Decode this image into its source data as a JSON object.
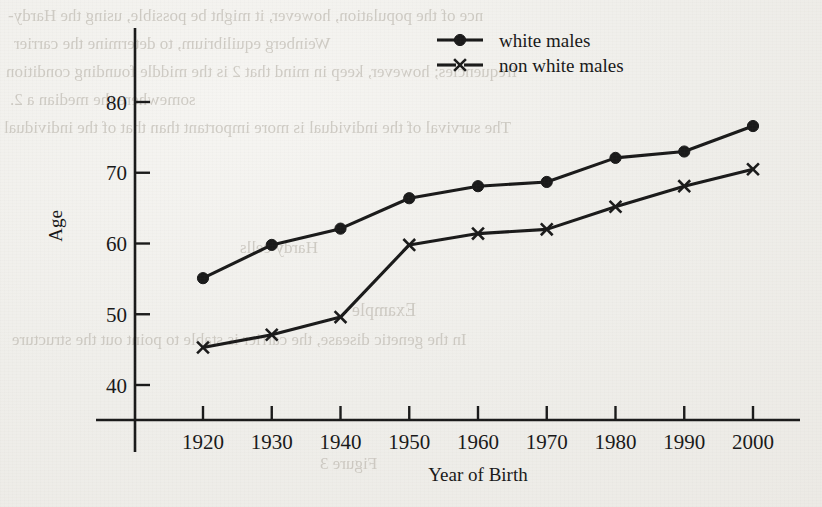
{
  "figure": {
    "kind": "scanned-book-figure",
    "ink_color": "#1a1a1a",
    "paper_color": "#f1efec"
  },
  "bleed_through_text": [
    {
      "text": "nce of the population, however, it might be possible, using the Hardy-",
      "x": 8,
      "y": 6,
      "size": 17
    },
    {
      "text": "Weinberg equilibrium, to determine the carrier",
      "x": 14,
      "y": 34,
      "size": 17
    },
    {
      "text": "frequencies; however, keep in mind that 2 is the middle founding condition",
      "x": 6,
      "y": 62,
      "size": 17
    },
    {
      "text": "somewhere the median a 2.",
      "x": 10,
      "y": 90,
      "size": 17
    },
    {
      "text": "The survival of the individual is more important than that of the individual",
      "x": 4,
      "y": 118,
      "size": 17
    },
    {
      "text": "Example",
      "x": 352,
      "y": 300,
      "size": 18
    },
    {
      "text": "In the genetic disease, the carrier is stable to point out the structure",
      "x": 12,
      "y": 330,
      "size": 17
    },
    {
      "text": "Hardy cells",
      "x": 240,
      "y": 238,
      "size": 17
    },
    {
      "text": "Figure 3",
      "x": 320,
      "y": 454,
      "size": 17
    }
  ],
  "chart_data": {
    "type": "line",
    "title": "",
    "xlabel": "Year of Birth",
    "ylabel": "Age",
    "x": [
      1920,
      1930,
      1940,
      1950,
      1960,
      1970,
      1980,
      1990,
      2000
    ],
    "xtick_labels": [
      "1920",
      "1930",
      "1940",
      "1950",
      "1960",
      "1970",
      "1980",
      "1990",
      "2000"
    ],
    "ytick_labels": [
      "40",
      "50",
      "60",
      "70",
      "80"
    ],
    "yticks": [
      40,
      50,
      60,
      70,
      80
    ],
    "xlim": [
      1913,
      2006
    ],
    "ylim": [
      34,
      85
    ],
    "grid": false,
    "legend_position": "top-center-right",
    "series": [
      {
        "name": "white males",
        "marker": "filled-circle",
        "color": "#1a1a1a",
        "values": [
          55.1,
          59.8,
          62.1,
          66.4,
          68.1,
          68.7,
          72.1,
          73.0,
          76.6
        ]
      },
      {
        "name": "non white males",
        "marker": "x-cross",
        "color": "#1a1a1a",
        "values": [
          45.3,
          47.1,
          49.6,
          59.8,
          61.4,
          62.0,
          65.2,
          68.1,
          70.5
        ]
      }
    ]
  },
  "legend": {
    "entries": [
      {
        "label": "white males",
        "marker": "filled-circle"
      },
      {
        "label": "non white males",
        "marker": "x-cross"
      }
    ]
  }
}
